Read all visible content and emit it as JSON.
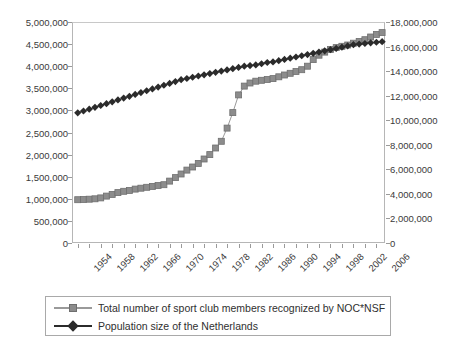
{
  "chart_data": {
    "type": "line",
    "title": "",
    "xlabel": "",
    "ylabel": "",
    "grid": false,
    "legend_position": "bottom",
    "x": [
      1954,
      1955,
      1956,
      1957,
      1958,
      1959,
      1960,
      1961,
      1962,
      1963,
      1964,
      1965,
      1966,
      1967,
      1968,
      1969,
      1970,
      1971,
      1972,
      1973,
      1974,
      1975,
      1976,
      1977,
      1978,
      1979,
      1980,
      1981,
      1982,
      1983,
      1984,
      1985,
      1986,
      1987,
      1988,
      1989,
      1990,
      1991,
      1992,
      1993,
      1994,
      1995,
      1996,
      1997,
      1998,
      1999,
      2000,
      2001,
      2002,
      2003,
      2004,
      2005,
      2006,
      2007
    ],
    "xtick_labels": [
      "1954",
      "1958",
      "1962",
      "1966",
      "1970",
      "1974",
      "1978",
      "1982",
      "1986",
      "1990",
      "1994",
      "1998",
      "2002",
      "2006"
    ],
    "xtick_values": [
      1954,
      1958,
      1962,
      1966,
      1970,
      1974,
      1978,
      1982,
      1986,
      1990,
      1994,
      1998,
      2002,
      2006
    ],
    "xlim": [
      1953,
      2007.5
    ],
    "left_axis": {
      "ylim": [
        0,
        5000000
      ],
      "ticks": [
        0,
        500000,
        1000000,
        1500000,
        2000000,
        2500000,
        3000000,
        3500000,
        4000000,
        4500000,
        5000000
      ],
      "tick_labels": [
        "0",
        "500,000",
        "1,000,000",
        "1,500,000",
        "2,000,000",
        "2,500,000",
        "3,000,000",
        "3,500,000",
        "4,000,000",
        "4,500,000",
        "5,000,000"
      ]
    },
    "right_axis": {
      "ylim": [
        0,
        18000000
      ],
      "ticks": [
        0,
        2000000,
        4000000,
        6000000,
        8000000,
        10000000,
        12000000,
        14000000,
        16000000,
        18000000
      ],
      "tick_labels": [
        "0",
        "2,000,000",
        "4,000,000",
        "6,000,000",
        "8,000,000",
        "10,000,000",
        "12,000,000",
        "14,000,000",
        "16,000,000",
        "18,000,000"
      ]
    },
    "series": [
      {
        "name": "Total number of sport club members recognized by NOC*NSF",
        "axis": "left",
        "marker": "square",
        "color": "#8c8c8c",
        "line_color": "#9a9a9a",
        "values": [
          980000,
          985000,
          990000,
          1000000,
          1020000,
          1060000,
          1100000,
          1140000,
          1170000,
          1190000,
          1220000,
          1240000,
          1260000,
          1280000,
          1300000,
          1320000,
          1400000,
          1480000,
          1560000,
          1650000,
          1720000,
          1800000,
          1900000,
          2000000,
          2150000,
          2300000,
          2600000,
          2950000,
          3350000,
          3550000,
          3620000,
          3660000,
          3680000,
          3700000,
          3720000,
          3760000,
          3800000,
          3840000,
          3880000,
          3920000,
          4000000,
          4150000,
          4250000,
          4320000,
          4380000,
          4420000,
          4450000,
          4480000,
          4520000,
          4560000,
          4600000,
          4660000,
          4720000,
          4760000
        ]
      },
      {
        "name": "Population size of the Netherlands",
        "axis": "right",
        "marker": "diamond",
        "color": "#2b2b2b",
        "line_color": "#2b2b2b",
        "values": [
          10600000,
          10750000,
          10900000,
          11050000,
          11200000,
          11350000,
          11500000,
          11650000,
          11800000,
          11950000,
          12100000,
          12250000,
          12400000,
          12550000,
          12700000,
          12850000,
          13000000,
          13150000,
          13300000,
          13400000,
          13500000,
          13600000,
          13700000,
          13800000,
          13900000,
          14000000,
          14100000,
          14200000,
          14300000,
          14400000,
          14450000,
          14500000,
          14600000,
          14700000,
          14750000,
          14850000,
          14950000,
          15050000,
          15150000,
          15250000,
          15350000,
          15450000,
          15550000,
          15650000,
          15750000,
          15850000,
          15950000,
          16050000,
          16150000,
          16200000,
          16250000,
          16300000,
          16350000,
          16400000
        ]
      }
    ]
  },
  "legend": {
    "entries": [
      {
        "label": "Total number of sport club members recognized by NOC*NSF",
        "marker": "square"
      },
      {
        "label": "Population size of the Netherlands",
        "marker": "diamond"
      }
    ]
  },
  "colors": {
    "series_members": "#8c8c8c",
    "series_population": "#2b2b2b",
    "axis": "#b6b6b6",
    "text": "#3a3a3a"
  }
}
